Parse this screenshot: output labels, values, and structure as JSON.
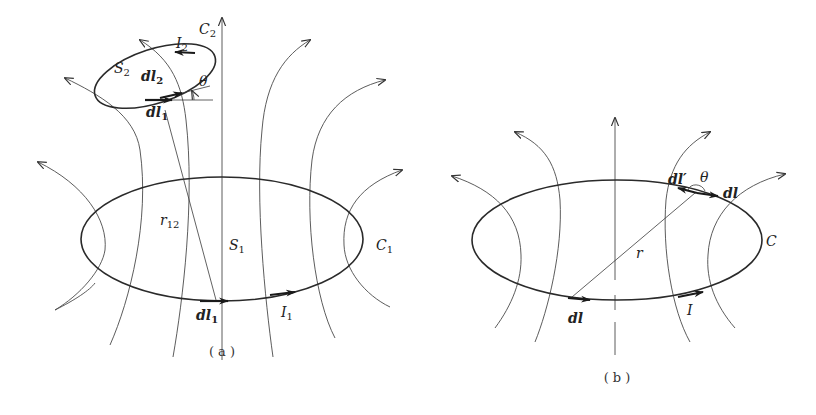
{
  "figure_a": {
    "caption": "( a )",
    "loop_large": {
      "label": "C",
      "sub": "1",
      "surface": "S",
      "surface_sub": "1",
      "current": "I",
      "current_sub": "1"
    },
    "loop_small": {
      "label": "C",
      "sub": "2",
      "surface": "S",
      "surface_sub": "2",
      "current": "I",
      "current_sub": "2"
    },
    "element_dl2": {
      "d": "d",
      "l": "l",
      "sub": "2"
    },
    "element_dl1_top": {
      "d": "d",
      "l": "l",
      "sub": "1"
    },
    "element_dl1_bottom": {
      "d": "d",
      "l": "l",
      "sub": "1"
    },
    "distance": {
      "r": "r",
      "sub": "12"
    },
    "angle": "θ"
  },
  "figure_b": {
    "caption": "( b )",
    "loop": {
      "label": "C",
      "current": "I"
    },
    "element_dl_bottom": "dl",
    "element_dl_top": "dl",
    "element_dl_prime": "dl′",
    "distance": "r",
    "angle": "θ"
  },
  "colors": {
    "line": "#2a2a2a",
    "field": "#4a4a4a",
    "background": "#ffffff"
  }
}
